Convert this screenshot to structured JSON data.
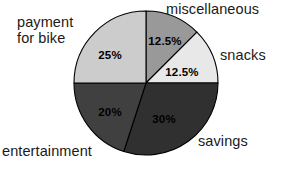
{
  "chart_data": {
    "type": "pie",
    "title": "",
    "subtitle": "",
    "xlabel": "",
    "ylabel": "",
    "legend_position": "none",
    "grid": false,
    "labels_outside": true,
    "start_angle_deg": 0,
    "direction": "clockwise",
    "categories": [
      "miscellaneous",
      "snacks",
      "savings",
      "entertainment",
      "payment for bike"
    ],
    "values": [
      12.5,
      12.5,
      30,
      20,
      25
    ],
    "value_labels": [
      "12.5%",
      "12.5%",
      "30%",
      "20%",
      "25%"
    ],
    "colors": [
      "#999999",
      "#e8e8e8",
      "#303030",
      "#404040",
      "#cccccc"
    ],
    "slices": [
      {
        "name": "miscellaneous",
        "value": 12.5,
        "value_label": "12.5%",
        "color": "#999999",
        "label_color": "#000000",
        "start_deg": 0,
        "end_deg": 45,
        "pct_x": 165,
        "pct_y": 41,
        "category_label": "miscellaneous"
      },
      {
        "name": "snacks",
        "value": 12.5,
        "value_label": "12.5%",
        "color": "#e8e8e8",
        "label_color": "#000000",
        "start_deg": 45,
        "end_deg": 90,
        "pct_x": 182,
        "pct_y": 72,
        "category_label": "snacks"
      },
      {
        "name": "savings",
        "value": 30,
        "value_label": "30%",
        "color": "#303030",
        "label_color": "#000000",
        "start_deg": 90,
        "end_deg": 198,
        "pct_x": 164,
        "pct_y": 119,
        "category_label": "savings"
      },
      {
        "name": "entertainment",
        "value": 20,
        "value_label": "20%",
        "color": "#404040",
        "label_color": "#000000",
        "start_deg": 198,
        "end_deg": 270,
        "pct_x": 110,
        "pct_y": 112,
        "category_label": "entertainment"
      },
      {
        "name": "payment for bike",
        "value": 25,
        "value_label": "25%",
        "color": "#cccccc",
        "label_color": "#000000",
        "start_deg": 270,
        "end_deg": 360,
        "pct_x": 110,
        "pct_y": 55,
        "category_label": "payment for bike"
      }
    ],
    "geometry": {
      "center_x": 146,
      "center_y": 83,
      "radius": 72,
      "outline_color": "#000000"
    }
  },
  "labels": {
    "miscellaneous": "miscellaneous",
    "snacks": "snacks",
    "savings": "savings",
    "entertainment": "entertainment",
    "payment_for_bike_line1": "payment",
    "payment_for_bike_line2": "for bike"
  }
}
